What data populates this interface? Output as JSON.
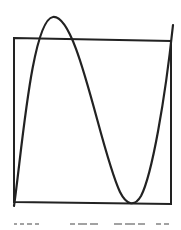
{
  "figure": {
    "colors": {
      "stroke": "#222222",
      "background": "#ffffff"
    },
    "box": {
      "x1": 14,
      "y1": 38,
      "x2": 171,
      "y2": 203
    },
    "curve": {
      "start": [
        14,
        205
      ],
      "local_max": [
        53,
        17
      ],
      "local_min": [
        133,
        203
      ],
      "end": [
        173,
        25
      ]
    },
    "caption_text": "illegible"
  }
}
